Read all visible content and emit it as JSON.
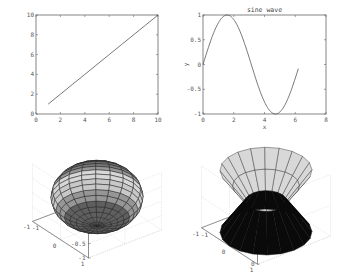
{
  "figure": {
    "background": "#ffffff",
    "axis_color": "#666666",
    "line_color": "#555555"
  },
  "chart_data": [
    {
      "type": "line",
      "title": "",
      "xlabel": "",
      "ylabel": "",
      "x": [
        1,
        2,
        3,
        4,
        5,
        6,
        7,
        8,
        9,
        10
      ],
      "values": [
        1,
        2,
        3,
        4,
        5,
        6,
        7,
        8,
        9,
        10
      ],
      "xlim": [
        0,
        10
      ],
      "ylim": [
        0,
        10
      ],
      "xticks": [
        "0",
        "2",
        "4",
        "6",
        "8",
        "10"
      ],
      "yticks": [
        "0",
        "2",
        "4",
        "6",
        "8",
        "10"
      ],
      "grid": false
    },
    {
      "type": "line",
      "title": "sine wave",
      "xlabel": "x",
      "ylabel": "y",
      "function": "sin(x)",
      "x_range": [
        0,
        6.2
      ],
      "xlim": [
        0,
        8
      ],
      "ylim": [
        -1,
        1
      ],
      "xticks": [
        "0",
        "2",
        "4",
        "6",
        "8"
      ],
      "yticks": [
        "-1",
        "-0.5",
        "0",
        "0.5",
        "1"
      ],
      "grid": false
    },
    {
      "type": "surface",
      "title": "",
      "shape": "ellipsoid (sphere, flattened z)",
      "xlim": [
        -1,
        1
      ],
      "ylim": [
        -1,
        1
      ],
      "zlim": [
        -1,
        1
      ],
      "xticks": [
        "-1",
        "0",
        "1"
      ],
      "yticks": [
        "-1",
        "0",
        "1"
      ],
      "zticks": [
        "-1",
        "-0.5",
        "0",
        "0.5",
        "1"
      ],
      "grid": true
    },
    {
      "type": "surface",
      "title": "",
      "shape": "double cone (upper light, lower dark)",
      "xlim": [
        -1,
        1
      ],
      "ylim": [
        -1,
        1
      ],
      "zlim": [
        0,
        1
      ],
      "xticks": [
        "-1",
        "0",
        "1"
      ],
      "yticks": [
        "-1",
        "0",
        "1"
      ],
      "zticks": [
        "0",
        "0.5",
        "1"
      ],
      "grid": true
    }
  ]
}
